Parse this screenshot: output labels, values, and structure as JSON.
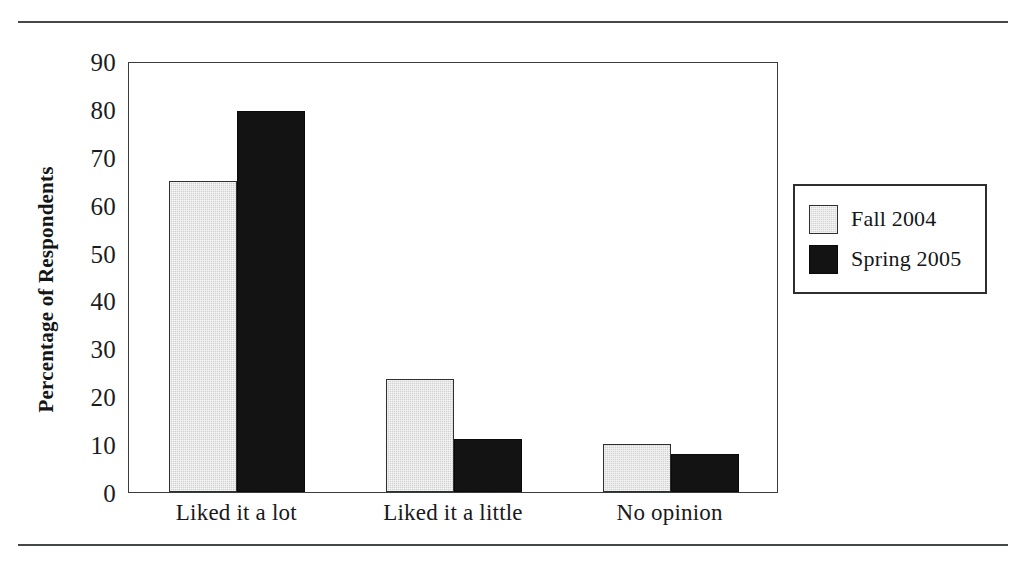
{
  "chart_data": {
    "type": "bar",
    "title": "",
    "xlabel": "",
    "ylabel": "Percentage of Respondents",
    "ylim": [
      0,
      90
    ],
    "ytick_step": 10,
    "yticks": [
      90,
      80,
      70,
      60,
      50,
      40,
      30,
      20,
      10,
      0
    ],
    "grid": false,
    "legend_position": "right",
    "categories": [
      "Liked it a lot",
      "Liked it a little",
      "No opinion"
    ],
    "series": [
      {
        "name": "Fall 2004",
        "values": [
          65,
          23.5,
          10
        ],
        "color": "#d2d2d2"
      },
      {
        "name": "Spring 2005",
        "values": [
          79.5,
          11,
          8
        ],
        "color": "#131313"
      }
    ]
  },
  "legend": {
    "entries": [
      {
        "label": "Fall 2004",
        "swatch": "light-gray-swatch"
      },
      {
        "label": "Spring 2005",
        "swatch": "black-swatch"
      }
    ]
  },
  "colors": {
    "fall_2004": "#d2d2d2",
    "spring_2005": "#131313",
    "rule": "#45474a",
    "axis": "#3a3c3f",
    "text": "#18191b"
  }
}
